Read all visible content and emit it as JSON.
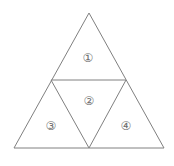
{
  "figure": {
    "background_color": "#ffffff",
    "stroke_color": "#808080",
    "label_color": "#6e6e6e",
    "stroke_width": 1,
    "width": 174,
    "height": 166
  },
  "outer_triangle": {
    "name": "outer-triangle",
    "points": "89,13 164,148 14,148",
    "vertices": {
      "apex": {
        "x": 89,
        "y": 13
      },
      "bottom_left": {
        "x": 14,
        "y": 148
      },
      "bottom_right": {
        "x": 164,
        "y": 148
      }
    }
  },
  "midpoints": {
    "left_side": {
      "x": 51,
      "y": 80
    },
    "right_side": {
      "x": 126,
      "y": 80
    },
    "base_center": {
      "x": 89,
      "y": 148
    }
  },
  "inner_lines": [
    {
      "name": "midline-horizontal",
      "x1": 51,
      "y1": 80,
      "x2": 126,
      "y2": 80
    },
    {
      "name": "midline-left-diagonal",
      "x1": 51,
      "y1": 80,
      "x2": 89,
      "y2": 148
    },
    {
      "name": "midline-right-diagonal",
      "x1": 126,
      "y1": 80,
      "x2": 89,
      "y2": 148
    }
  ],
  "regions": [
    {
      "id": "region-1",
      "label": "①",
      "number": 1,
      "position": {
        "x": 88,
        "y": 58
      },
      "points": "89,13 126,80 51,80"
    },
    {
      "id": "region-2",
      "label": "②",
      "number": 2,
      "position": {
        "x": 89,
        "y": 101
      },
      "points": "51,80 126,80 89,148"
    },
    {
      "id": "region-3",
      "label": "③",
      "number": 3,
      "position": {
        "x": 51,
        "y": 126
      },
      "points": "51,80 89,148 14,148"
    },
    {
      "id": "region-4",
      "label": "④",
      "number": 4,
      "position": {
        "x": 126,
        "y": 126
      },
      "points": "126,80 164,148 89,148"
    }
  ]
}
